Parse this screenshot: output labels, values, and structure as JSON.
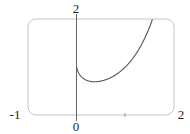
{
  "chart_data": {
    "type": "line",
    "title": "",
    "xlabel": "",
    "ylabel": "",
    "function": "y = x^x",
    "xlim": [
      -1,
      2
    ],
    "ylim": [
      0,
      2
    ],
    "grid": false,
    "legend": null,
    "tick_labels": {
      "x_left": "-1",
      "x_origin": "0",
      "x_right": "2",
      "y_top": "2"
    },
    "series": [
      {
        "name": "x^x",
        "x": [
          0.0,
          0.05,
          0.1,
          0.2,
          0.3,
          0.37,
          0.5,
          0.7,
          0.9,
          1.0,
          1.2,
          1.4,
          1.56
        ],
        "values": [
          1.0,
          0.86,
          0.79,
          0.72,
          0.7,
          0.69,
          0.71,
          0.78,
          0.91,
          1.0,
          1.24,
          1.6,
          2.0
        ]
      }
    ],
    "colors": {
      "curve": "#555555",
      "axes": "#555555",
      "frame": "#bbbbbb"
    }
  }
}
